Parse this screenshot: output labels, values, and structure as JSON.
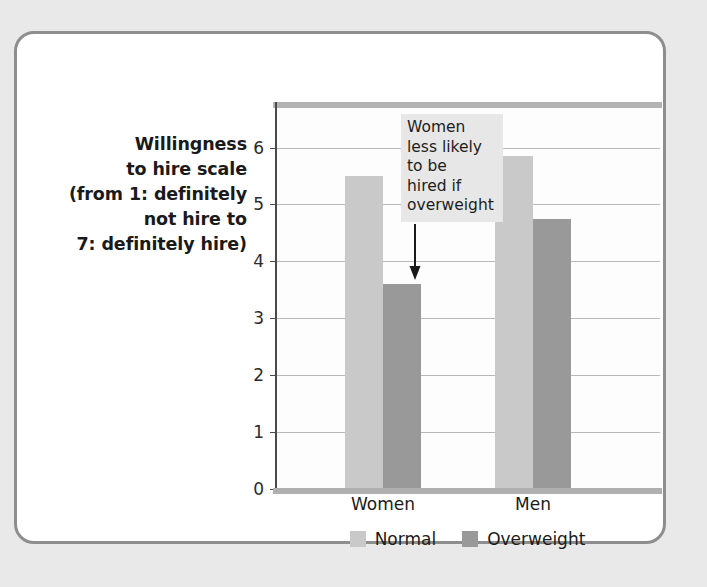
{
  "figure": {
    "y_axis_caption_lines": [
      "Willingness",
      "to hire scale",
      "(from 1: definitely",
      "not hire to",
      "7: definitely hire)"
    ],
    "annotation_lines": [
      "Women",
      "less likely",
      "to be",
      "hired if",
      "overweight"
    ],
    "annotation_icon": "down-arrow-icon",
    "colors": {
      "normal": "#c9c9c9",
      "overweight": "#999999",
      "frame": "#8e8e8e",
      "gridline": "#b9b9b9",
      "annotation_background": "#e7e7e7",
      "page_background": "#e9e9e9"
    }
  },
  "chart_data": {
    "type": "bar",
    "title": "",
    "xlabel": "",
    "ylabel": "Willingness to hire scale (from 1: definitely not hire to 7: definitely hire)",
    "categories": [
      "Women",
      "Men"
    ],
    "series": [
      {
        "name": "Normal",
        "values": [
          5.5,
          5.85
        ],
        "color": "#c9c9c9"
      },
      {
        "name": "Overweight",
        "values": [
          3.6,
          4.75
        ],
        "color": "#999999"
      }
    ],
    "ylim": [
      0,
      6.8
    ],
    "yticks": [
      0,
      1,
      2,
      3,
      4,
      5,
      6
    ],
    "ytick_labels": [
      "0",
      "1",
      "2",
      "3",
      "4",
      "5",
      "6"
    ],
    "grid": true,
    "legend_position": "bottom",
    "annotations": [
      {
        "text": "Women less likely to be hired if overweight",
        "target_category": "Women",
        "target_series": "Overweight"
      }
    ]
  }
}
